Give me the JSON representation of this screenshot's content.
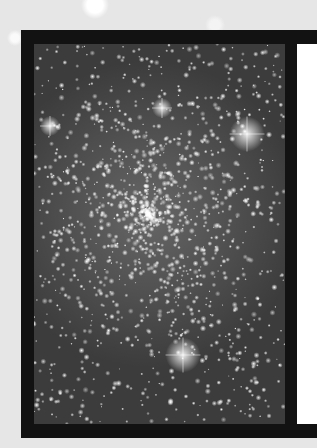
{
  "image": {
    "subject": "globular star cluster photograph",
    "caption": "",
    "colors": {
      "background": "#e6e6e6",
      "frame": "#121212",
      "sky": "#3c3c3c",
      "panel": "#ffffff"
    },
    "bright_stars": [
      {
        "x": 213,
        "y": 90,
        "size": 7
      },
      {
        "x": 149,
        "y": 311,
        "size": 7
      },
      {
        "x": 16,
        "y": 82,
        "size": 4
      },
      {
        "x": 128,
        "y": 64,
        "size": 4
      }
    ],
    "cluster_center": {
      "x": 115,
      "y": 170,
      "radius": 110
    }
  }
}
